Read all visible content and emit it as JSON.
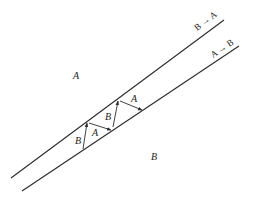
{
  "diagram": {
    "regions": {
      "upper_left_label": "A",
      "lower_right_label": "B"
    },
    "boundaries": [
      {
        "label": "B → A",
        "x1": 11,
        "y1": 178,
        "x2": 224,
        "y2": 20
      },
      {
        "label": "A → B",
        "x1": 22,
        "y1": 191,
        "x2": 239,
        "y2": 46
      }
    ],
    "arrows": [
      {
        "label": "B",
        "x1": 83,
        "y1": 149,
        "x2": 87,
        "y2": 123
      },
      {
        "label": "A",
        "x1": 89,
        "y1": 123,
        "x2": 111,
        "y2": 130
      },
      {
        "label": "B",
        "x1": 113,
        "y1": 127,
        "x2": 118,
        "y2": 101
      },
      {
        "label": "A",
        "x1": 120,
        "y1": 101,
        "x2": 142,
        "y2": 110
      }
    ],
    "colors": {
      "line": "#2a2a2a",
      "background": "#ffffff"
    }
  }
}
